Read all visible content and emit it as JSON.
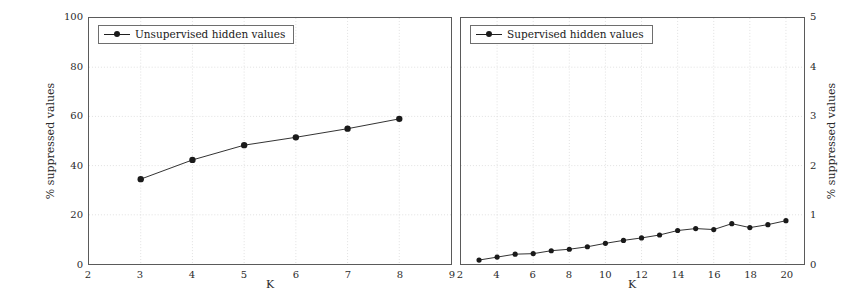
{
  "figure": {
    "background": "#ffffff",
    "series_color": "#1a1a1a",
    "grid_color": "#d9d9d9",
    "axis_color": "#5a5a5a"
  },
  "chart_data": [
    {
      "type": "line",
      "panel": "left",
      "title": "",
      "xlabel": "K",
      "ylabel": "% suppressed values",
      "ylabel_side": "left",
      "xlim": [
        2,
        9
      ],
      "ylim": [
        0,
        100
      ],
      "xticks": [
        2,
        3,
        4,
        5,
        6,
        7,
        8,
        9
      ],
      "yticks": [
        0,
        20,
        40,
        60,
        80,
        100
      ],
      "xtick_labels": [
        "2",
        "3",
        "4",
        "5",
        "6",
        "7",
        "8",
        "9"
      ],
      "ytick_labels": [
        "0",
        "20",
        "40",
        "60",
        "80",
        "100"
      ],
      "grid": true,
      "legend": {
        "position": "top-left",
        "entries": [
          "Unsupervised hidden values"
        ]
      },
      "series": [
        {
          "name": "Unsupervised hidden values",
          "marker": "circle",
          "x": [
            3,
            4,
            5,
            6,
            7,
            8
          ],
          "values": [
            34.5,
            42.3,
            48.3,
            51.5,
            55.0,
            59.0
          ]
        }
      ]
    },
    {
      "type": "line",
      "panel": "right",
      "title": "",
      "xlabel": "K",
      "ylabel": "% suppressed values",
      "ylabel_side": "right",
      "xlim": [
        2,
        21
      ],
      "ylim": [
        0,
        5
      ],
      "xticks": [
        2,
        4,
        6,
        8,
        10,
        12,
        14,
        16,
        18,
        20
      ],
      "yticks": [
        0,
        1,
        2,
        3,
        4,
        5
      ],
      "xtick_labels": [
        "2",
        "4",
        "6",
        "8",
        "10",
        "12",
        "14",
        "16",
        "18",
        "20"
      ],
      "ytick_labels": [
        "0",
        "1",
        "2",
        "3",
        "4",
        "5"
      ],
      "grid": true,
      "legend": {
        "position": "top-left",
        "entries": [
          "Supervised hidden values"
        ]
      },
      "series": [
        {
          "name": "Supervised hidden values",
          "marker": "circle",
          "x": [
            3,
            4,
            5,
            6,
            7,
            8,
            9,
            10,
            11,
            12,
            13,
            14,
            15,
            16,
            17,
            18,
            19,
            20
          ],
          "values": [
            0.08,
            0.14,
            0.2,
            0.21,
            0.27,
            0.3,
            0.35,
            0.42,
            0.48,
            0.53,
            0.59,
            0.68,
            0.72,
            0.7,
            0.82,
            0.74,
            0.8,
            0.88
          ]
        }
      ]
    }
  ],
  "left_panel": {
    "legend_label": "Unsupervised hidden values",
    "xlabel": "K",
    "ylabel": "% suppressed values"
  },
  "right_panel": {
    "legend_label": "Supervised hidden values",
    "xlabel": "K",
    "ylabel": "% suppressed values"
  }
}
